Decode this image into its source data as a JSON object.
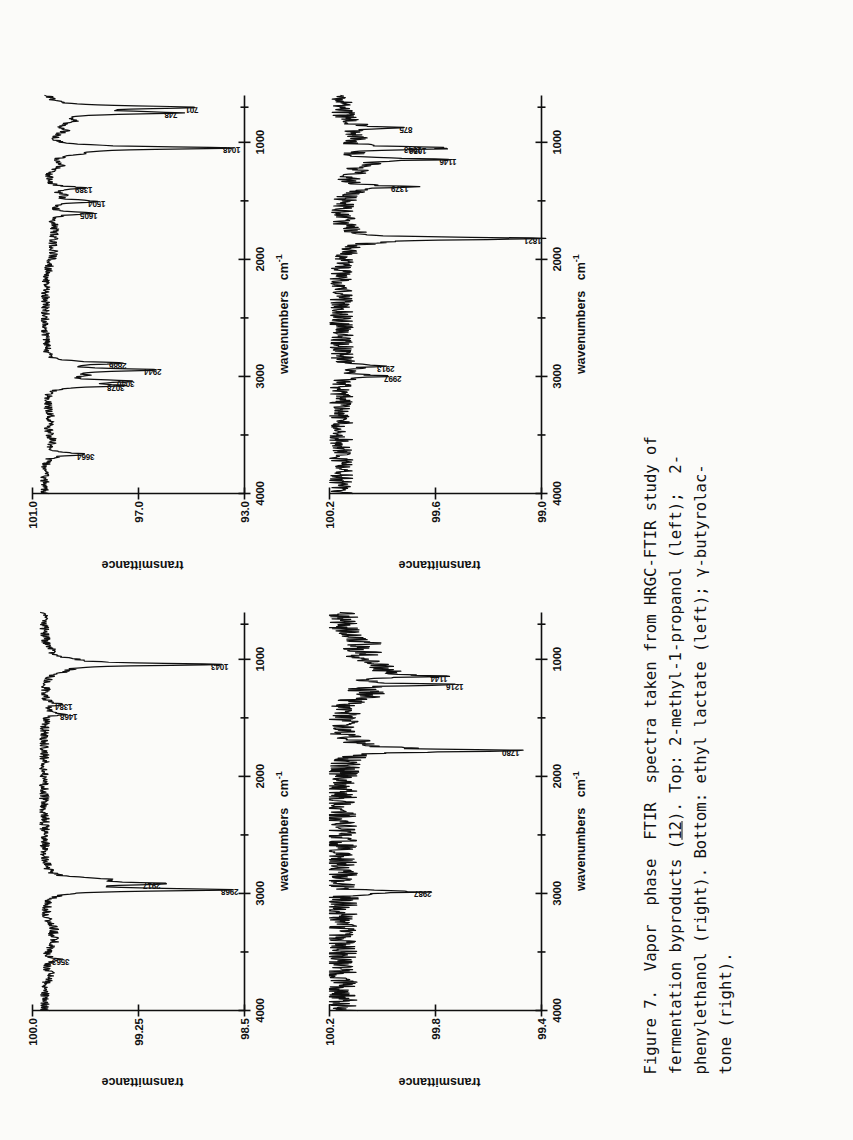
{
  "figure": {
    "number": "Figure 7.",
    "caption_lines": [
      "Figure 7.  Vapor  phase  FTIR  spectra taken from HRGC-FTIR study of",
      "fermentation byproducts (12). Top: 2-methyl-1-propanol (left);  2-",
      "phenylethanol (right). Bottom: ethyl lactate (left); γ-butyrolac-",
      "tone (right)."
    ],
    "caption_plain": "Figure 7. Vapor phase FTIR spectra taken from HRGC-FTIR study of fermentation byproducts (12). Top: 2-methyl-1-propanol (left); 2-phenylethanol (right). Bottom: ethyl lactate (left); γ-butyrolactone (right).",
    "underlined_token": "12"
  },
  "axis_titles": {
    "x_label": "wavenumbers",
    "x_units_base": "cm",
    "x_units_exp": "-1",
    "y_label": "transmittance"
  },
  "chart_data": [
    {
      "id": "top-left",
      "type": "line",
      "title": "2-methyl-1-propanol",
      "position": "Top left",
      "xlabel": "wavenumbers cm-1",
      "ylabel": "transmittance",
      "xlim": [
        4000,
        600
      ],
      "xticks": [
        4000,
        3000,
        2000,
        1000
      ],
      "xtick_labels": [
        "4000",
        "3000",
        "2000",
        "1000"
      ],
      "xminor": [
        3500,
        2500,
        1500,
        700
      ],
      "ylim": [
        98.5,
        100.0
      ],
      "yticks": [
        100.0,
        99.25,
        98.5
      ],
      "ytick_labels": [
        "100.0",
        "99.25",
        "98.5"
      ],
      "grid": false,
      "peaks": [
        {
          "wavenumber": 3563,
          "label": "3563",
          "transmittance": 99.82
        },
        {
          "wavenumber": 2968,
          "label": "2968",
          "transmittance": 98.63
        },
        {
          "wavenumber": 2917,
          "label": "2917",
          "transmittance": 99.18
        },
        {
          "wavenumber": 1468,
          "label": "1468",
          "transmittance": 99.77
        },
        {
          "wavenumber": 1384,
          "label": "1384",
          "transmittance": 99.8
        },
        {
          "wavenumber": 1043,
          "label": "1043",
          "transmittance": 98.7
        }
      ]
    },
    {
      "id": "top-right",
      "type": "line",
      "title": "2-phenylethanol",
      "position": "Top right",
      "xlabel": "wavenumbers cm-1",
      "ylabel": "transmittance",
      "xlim": [
        4000,
        600
      ],
      "xticks": [
        4000,
        3000,
        2000,
        1000
      ],
      "xtick_labels": [
        "4000",
        "3000",
        "2000",
        "1000"
      ],
      "xminor": [
        3500,
        2500,
        1500,
        700
      ],
      "ylim": [
        93.0,
        101.0
      ],
      "yticks": [
        101.0,
        97.0,
        93.0
      ],
      "ytick_labels": [
        "101.0",
        "97.0",
        "93.0"
      ],
      "grid": false,
      "peaks": [
        {
          "wavenumber": 3664,
          "label": "3664",
          "transmittance": 99.1
        },
        {
          "wavenumber": 3078,
          "label": "3078",
          "transmittance": 98.0
        },
        {
          "wavenumber": 3040,
          "label": "3040",
          "transmittance": 97.6
        },
        {
          "wavenumber": 2944,
          "label": "2944",
          "transmittance": 96.6
        },
        {
          "wavenumber": 2886,
          "label": "2886",
          "transmittance": 97.9
        },
        {
          "wavenumber": 1605,
          "label": "1605",
          "transmittance": 99.0
        },
        {
          "wavenumber": 1504,
          "label": "1504",
          "transmittance": 98.7
        },
        {
          "wavenumber": 1389,
          "label": "1389",
          "transmittance": 99.2
        },
        {
          "wavenumber": 1048,
          "label": "1048",
          "transmittance": 93.6
        },
        {
          "wavenumber": 748,
          "label": "748",
          "transmittance": 96.0
        },
        {
          "wavenumber": 701,
          "label": "701",
          "transmittance": 95.2
        }
      ]
    },
    {
      "id": "bottom-left",
      "type": "line",
      "title": "ethyl lactate",
      "position": "Bottom left",
      "xlabel": "wavenumbers cm-1",
      "ylabel": "transmittance",
      "xlim": [
        4000,
        600
      ],
      "xticks": [
        4000,
        3000,
        2000,
        1000
      ],
      "xtick_labels": [
        "4000",
        "3000",
        "2000",
        "1000"
      ],
      "xminor": [
        3500,
        2500,
        1500,
        700
      ],
      "ylim": [
        99.4,
        100.2
      ],
      "yticks": [
        100.2,
        99.8,
        99.4
      ],
      "ytick_labels": [
        "100.2",
        "99.8",
        "99.4"
      ],
      "grid": false,
      "peaks": [
        {
          "wavenumber": 2987,
          "label": "2987",
          "transmittance": 99.86
        },
        {
          "wavenumber": 1780,
          "label": "1780",
          "transmittance": 99.53
        },
        {
          "wavenumber": 1216,
          "label": "1216",
          "transmittance": 99.74
        },
        {
          "wavenumber": 1144,
          "label": "1144",
          "transmittance": 99.8
        }
      ]
    },
    {
      "id": "bottom-right",
      "type": "line",
      "title": "γ-butyrolactone",
      "position": "Bottom right",
      "xlabel": "wavenumbers cm-1",
      "ylabel": "transmittance",
      "xlim": [
        4000,
        600
      ],
      "xticks": [
        4000,
        3000,
        2000,
        1000
      ],
      "xtick_labels": [
        "4000",
        "3000",
        "2000",
        "1000"
      ],
      "xminor": [
        3500,
        2500,
        1500,
        700
      ],
      "ylim": [
        99.0,
        100.2
      ],
      "yticks": [
        100.2,
        99.6,
        99.0
      ],
      "ytick_labels": [
        "100.2",
        "99.6",
        "99.0"
      ],
      "grid": false,
      "peaks": [
        {
          "wavenumber": 2997,
          "label": "2997",
          "transmittance": 99.86
        },
        {
          "wavenumber": 2913,
          "label": "2913",
          "transmittance": 99.9
        },
        {
          "wavenumber": 1821,
          "label": "1821",
          "transmittance": 99.07
        },
        {
          "wavenumber": 1379,
          "label": "1379",
          "transmittance": 99.82
        },
        {
          "wavenumber": 1146,
          "label": "1146",
          "transmittance": 99.55
        },
        {
          "wavenumber": 1056,
          "label": "1056",
          "transmittance": 99.72
        },
        {
          "wavenumber": 1043,
          "label": "1043",
          "transmittance": 99.75
        },
        {
          "wavenumber": 875,
          "label": "875",
          "transmittance": 99.8
        }
      ]
    }
  ],
  "colors": {
    "ink": "#0f0f0f",
    "paper": "#fbfbf9"
  }
}
